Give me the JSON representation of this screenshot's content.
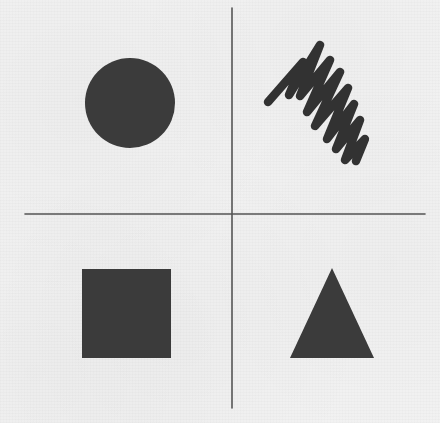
{
  "figure": {
    "canvas": {
      "width": 440,
      "height": 423
    },
    "colors": {
      "background": "#f2f2f2",
      "shape_fill": "#3a3a3a",
      "axis_line": "#555555",
      "scribble_stroke": "#333333"
    }
  },
  "axes": {
    "name": "crosshair",
    "origin": {
      "x": 232,
      "y": 214
    },
    "stroke_width": 1.6,
    "vertical": {
      "label": "vertical-axis",
      "x": 232,
      "y_start": 8,
      "y_end": 408
    },
    "horizontal": {
      "label": "horizontal-axis",
      "y": 214,
      "x_start": 25,
      "x_end": 425
    }
  },
  "quadrants": [
    {
      "id": "top-left",
      "position": "upper-left",
      "shape": "circle",
      "shape_label": "Filled circle",
      "fill": "#3a3a3a",
      "geometry": {
        "cx": 130,
        "cy": 103,
        "r": 45
      }
    },
    {
      "id": "top-right",
      "position": "upper-right",
      "shape": "scribble",
      "shape_label": "Hand-drawn zigzag scribble",
      "fill": "none",
      "stroke": "#333333",
      "stroke_width": 8.5,
      "peak_count": 8,
      "geometry": {
        "start": {
          "x": 268,
          "y": 102
        },
        "end": {
          "x": 365,
          "y": 161
        },
        "bounds": {
          "x": 264,
          "y": 42,
          "width": 106,
          "height": 124
        },
        "path": "M268,102 L303,62 L289,95 L320,45 L300,96 L330,60 L307,112 L340,72 L315,126 L348,88 L327,139 L354,104 L336,149 L360,120 L345,160 L365,139 L356,161"
      }
    },
    {
      "id": "bottom-left",
      "position": "lower-left",
      "shape": "square",
      "shape_label": "Filled square",
      "fill": "#3a3a3a",
      "geometry": {
        "x": 82,
        "y": 269,
        "width": 89,
        "height": 89
      }
    },
    {
      "id": "bottom-right",
      "position": "lower-right",
      "shape": "triangle",
      "shape_label": "Filled triangle",
      "fill": "#3a3a3a",
      "geometry": {
        "apex": {
          "x": 332,
          "y": 268
        },
        "base_left": {
          "x": 290,
          "y": 358
        },
        "base_right": {
          "x": 374,
          "y": 358
        },
        "points": "332,268 374,358 290,358"
      }
    }
  ]
}
